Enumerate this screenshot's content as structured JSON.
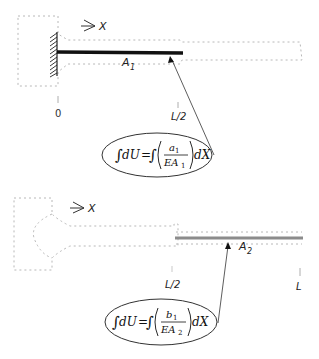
{
  "diagram": {
    "top": {
      "axis_label": "X",
      "member_label": "A",
      "member_subscript": "1",
      "ticks": [
        "0",
        "L/2"
      ],
      "equation": {
        "lhs": "∫dU =",
        "integral": "∫",
        "numerator": "a",
        "numerator_sub": "1",
        "denominator": "EA",
        "denominator_sub": "1",
        "tail": "dX"
      },
      "bar_color": "#111111"
    },
    "bottom": {
      "axis_label": "X",
      "member_label": "A",
      "member_subscript": "2",
      "ticks": [
        "L/2",
        "L"
      ],
      "equation": {
        "lhs": "∫dU =",
        "integral": "∫",
        "numerator": "b",
        "numerator_sub": "1",
        "denominator": "EA",
        "denominator_sub": "2",
        "tail": "dX"
      },
      "bar_color": "#8c8c8c"
    }
  }
}
